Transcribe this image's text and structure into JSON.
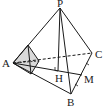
{
  "diagram": {
    "type": "pyramid",
    "labels": {
      "P": "P",
      "A": "A",
      "B": "B",
      "C": "C",
      "H": "H",
      "M": "M"
    },
    "colors": {
      "stroke": "#1a1a1a",
      "shade": "#d9d9d9"
    }
  }
}
